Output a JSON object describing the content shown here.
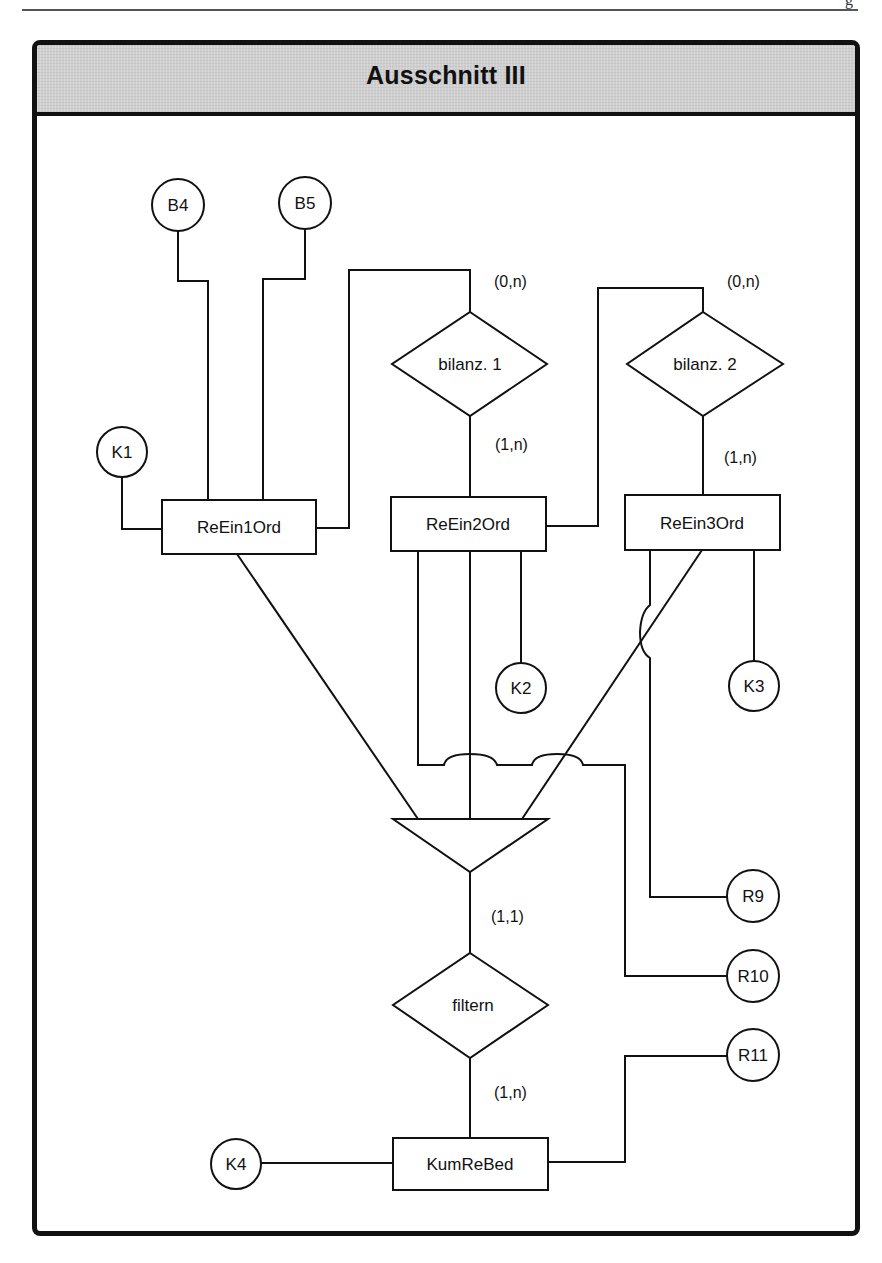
{
  "page": {
    "corner_glyph": "g"
  },
  "header": {
    "title": "Ausschnitt III"
  },
  "entities": [
    {
      "id": "ReEin1Ord",
      "label": "ReEin1Ord"
    },
    {
      "id": "ReEin2Ord",
      "label": "ReEin2Ord"
    },
    {
      "id": "ReEin3Ord",
      "label": "ReEin3Ord"
    },
    {
      "id": "KumReBed",
      "label": "KumReBed"
    }
  ],
  "relationships": [
    {
      "id": "bilanz1",
      "label": "bilanz. 1"
    },
    {
      "id": "bilanz2",
      "label": "bilanz. 2"
    },
    {
      "id": "filtern",
      "label": "filtern"
    }
  ],
  "attributes": [
    {
      "id": "B4",
      "label": "B4"
    },
    {
      "id": "B5",
      "label": "B5"
    },
    {
      "id": "K1",
      "label": "K1"
    },
    {
      "id": "K2",
      "label": "K2"
    },
    {
      "id": "K3",
      "label": "K3"
    },
    {
      "id": "K4",
      "label": "K4"
    },
    {
      "id": "R9",
      "label": "R9"
    },
    {
      "id": "R10",
      "label": "R10"
    },
    {
      "id": "R11",
      "label": "R11"
    }
  ],
  "cardinalities": {
    "bilanz1_top": "(0,n)",
    "bilanz1_bottom": "(1,n)",
    "bilanz2_top": "(0,n)",
    "bilanz2_bottom": "(1,n)",
    "generalization_bottom": "(1,1)",
    "filtern_bottom": "(1,n)"
  },
  "generalization": {
    "shape": "inverted-triangle",
    "members": [
      "ReEin1Ord",
      "ReEin2Ord",
      "ReEin3Ord"
    ]
  },
  "colors": {
    "header_bg": "#cfcfcf",
    "stroke": "#111111",
    "background": "#ffffff"
  }
}
